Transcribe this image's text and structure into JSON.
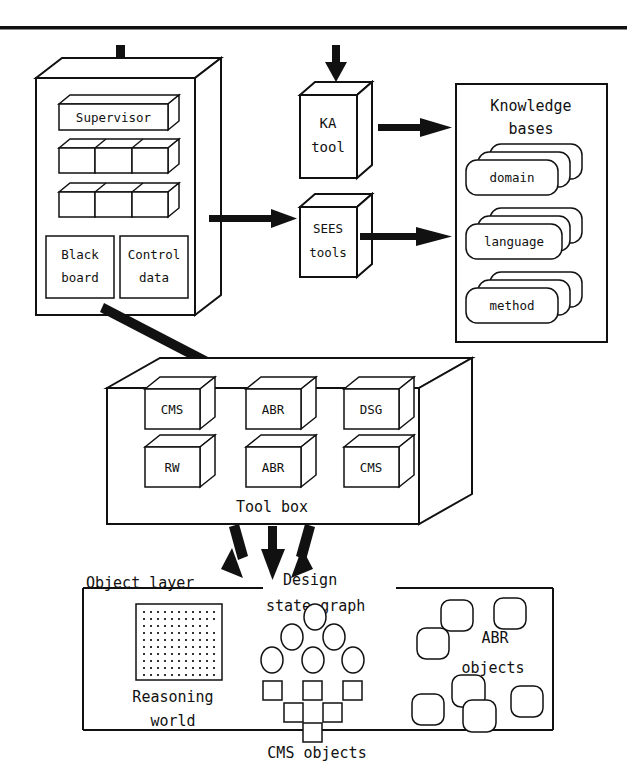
{
  "diagram": {
    "top_rule": true,
    "colors": {
      "ink": "#111111",
      "paper": "#ffffff"
    },
    "blackboard_system": {
      "name": "blackboard-system",
      "supervisor_label": "Supervisor",
      "ks_row_counts": [
        3,
        3
      ],
      "blackboard_label_line1": "Black",
      "blackboard_label_line2": "board",
      "control_label_line1": "Control",
      "control_label_line2": "data"
    },
    "ka_tool": {
      "line1": "KA",
      "line2": "tool"
    },
    "sees_tools": {
      "line1": "SEES",
      "line2": "tools"
    },
    "knowledge_bases": {
      "title_line1": "Knowledge",
      "title_line2": "bases",
      "stacks": [
        {
          "label": "domain"
        },
        {
          "label": "language"
        },
        {
          "label": "method"
        }
      ]
    },
    "tool_box": {
      "caption": "Tool box",
      "cubes_row1": [
        "CMS",
        "ABR",
        "DSG"
      ],
      "cubes_row2": [
        "RW",
        "ABR",
        "CMS"
      ]
    },
    "object_layer": {
      "label": "Object layer",
      "caption": "CMS objects",
      "design_label_line1": "Design",
      "design_label_line2": "state graph",
      "reasoning_label_line1": "Reasoning",
      "reasoning_label_line2": "world",
      "abr_label_line1": "ABR",
      "abr_label_line2": "objects",
      "graph_ellipse_rows": [
        1,
        2,
        3
      ],
      "graph_square_rows": [
        3,
        2,
        1
      ],
      "abr_object_count": 7
    },
    "arrows": [
      {
        "name": "input-to-blackboard",
        "direction": "down"
      },
      {
        "name": "input-to-ka-tool",
        "direction": "down"
      },
      {
        "name": "ka-tool-to-knowledge-bases",
        "direction": "right"
      },
      {
        "name": "blackboard-to-sees-tools",
        "direction": "right"
      },
      {
        "name": "sees-tools-to-knowledge-bases",
        "direction": "right"
      },
      {
        "name": "blackboard-to-tool-box",
        "direction": "down-right"
      },
      {
        "name": "tool-box-to-object-layer-left",
        "direction": "down-left"
      },
      {
        "name": "tool-box-to-object-layer-center",
        "direction": "down"
      },
      {
        "name": "tool-box-to-object-layer-right",
        "direction": "down-right"
      }
    ]
  }
}
